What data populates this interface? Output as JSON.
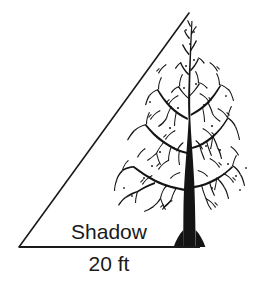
{
  "figure": {
    "background_color": "#ffffff",
    "ink_color": "#1a1a1a"
  },
  "labels": {
    "shadow": "Shadow",
    "measurement": "20 ft"
  },
  "triangle": {
    "apex": {
      "x": 189,
      "y": 13
    },
    "left_vertex": {
      "x": 19,
      "y": 247
    },
    "right_vertex": {
      "x": 200,
      "y": 247
    },
    "stroke_color": "#1a1a1a",
    "hypotenuse_width": 1.6,
    "base_width": 2.2
  },
  "tree": {
    "trunk_base": {
      "x": 190,
      "y": 247
    },
    "trunk_width": 13,
    "crown_left": 118,
    "crown_right": 247,
    "crown_top": 18,
    "color": "#141414"
  }
}
